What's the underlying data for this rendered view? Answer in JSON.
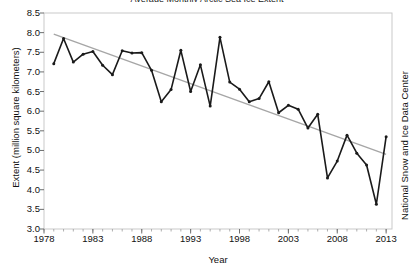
{
  "chart_data": {
    "type": "line",
    "title": "Average Monthly Arctic Sea Ice Extent",
    "xlabel": "Year",
    "ylabel": "Extent (million square kilometers)",
    "right_label": "National Snow and Ice Data Center",
    "xlim": [
      1978,
      2013.6
    ],
    "ylim": [
      3.0,
      8.5
    ],
    "xticks": [
      1978,
      1983,
      1988,
      1993,
      1998,
      2003,
      2008,
      2013
    ],
    "xtick_labels": [
      "1978",
      "1983",
      "1988",
      "1993",
      "1998",
      "2003",
      "2008",
      "2013"
    ],
    "minor_xtick_step": 1,
    "yticks": [
      3.0,
      3.5,
      4.0,
      4.5,
      5.0,
      5.5,
      6.0,
      6.5,
      7.0,
      7.5,
      8.0,
      8.5
    ],
    "ytick_labels": [
      "3.0",
      "3.5",
      "4.0",
      "4.5",
      "5.0",
      "5.5",
      "6.0",
      "6.5",
      "7.0",
      "7.5",
      "8.0",
      "8.5"
    ],
    "grid": false,
    "legend": null,
    "series": [
      {
        "name": "September sea ice extent",
        "color": "#1a1a1a",
        "marker": "circle",
        "x": [
          1979,
          1980,
          1981,
          1982,
          1983,
          1984,
          1985,
          1986,
          1987,
          1988,
          1989,
          1990,
          1991,
          1992,
          1993,
          1994,
          1995,
          1996,
          1997,
          1998,
          1999,
          2000,
          2001,
          2002,
          2003,
          2004,
          2005,
          2006,
          2007,
          2008,
          2009,
          2010,
          2011,
          2012,
          2013
        ],
        "values": [
          7.21,
          7.85,
          7.25,
          7.45,
          7.52,
          7.17,
          6.93,
          7.54,
          7.48,
          7.49,
          7.04,
          6.24,
          6.55,
          7.55,
          6.5,
          7.18,
          6.13,
          7.88,
          6.74,
          6.56,
          6.24,
          6.32,
          6.75,
          5.96,
          6.15,
          6.05,
          5.57,
          5.92,
          4.3,
          4.73,
          5.39,
          4.93,
          4.63,
          3.63,
          5.35
        ]
      },
      {
        "name": "Linear trend",
        "color": "#a6a6a6",
        "marker": "none",
        "x": [
          1979,
          2013
        ],
        "values": [
          7.96,
          4.9
        ]
      }
    ]
  }
}
